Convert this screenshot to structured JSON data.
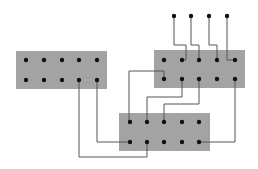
{
  "colors": {
    "background": "#ffffff",
    "block_fill": "#a3a3a3",
    "pin": "#111111",
    "wire": "#555555"
  },
  "blocks": [
    {
      "id": "left",
      "x": 16,
      "y": 51,
      "w": 91,
      "h": 38,
      "pins_x": [
        26,
        44,
        62,
        79,
        97
      ],
      "pins_y": [
        60,
        80
      ]
    },
    {
      "id": "right",
      "x": 154,
      "y": 50,
      "w": 91,
      "h": 38,
      "pins_x": [
        164,
        182,
        199,
        217,
        235
      ],
      "pins_y": [
        60,
        79
      ]
    },
    {
      "id": "bottom",
      "x": 119,
      "y": 113,
      "w": 91,
      "h": 38,
      "pins_x": [
        130,
        147,
        164,
        182,
        199
      ],
      "pins_y": [
        122,
        142
      ]
    }
  ],
  "terminals": [
    {
      "x": 174,
      "y": 16
    },
    {
      "x": 191,
      "y": 16
    },
    {
      "x": 209,
      "y": 16
    },
    {
      "x": 227,
      "y": 16
    }
  ],
  "wires": [
    {
      "points": [
        [
          174,
          16
        ],
        [
          174,
          45
        ],
        [
          186,
          45
        ],
        [
          186,
          60
        ],
        [
          182,
          60
        ]
      ]
    },
    {
      "points": [
        [
          191,
          16
        ],
        [
          191,
          45
        ],
        [
          199,
          45
        ],
        [
          199,
          60
        ]
      ]
    },
    {
      "points": [
        [
          209,
          16
        ],
        [
          209,
          45
        ],
        [
          217,
          45
        ],
        [
          217,
          60
        ]
      ]
    },
    {
      "points": [
        [
          227,
          16
        ],
        [
          227,
          60
        ],
        [
          235,
          60
        ]
      ]
    },
    {
      "points": [
        [
          164,
          79
        ],
        [
          164,
          71
        ],
        [
          129,
          71
        ],
        [
          129,
          122
        ],
        [
          130,
          122
        ]
      ]
    },
    {
      "points": [
        [
          182,
          79
        ],
        [
          182,
          97
        ],
        [
          147,
          97
        ],
        [
          147,
          122
        ]
      ]
    },
    {
      "points": [
        [
          199,
          79
        ],
        [
          199,
          104
        ],
        [
          164,
          104
        ],
        [
          164,
          122
        ]
      ]
    },
    {
      "points": [
        [
          235,
          79
        ],
        [
          235,
          142
        ],
        [
          199,
          142
        ]
      ]
    },
    {
      "points": [
        [
          97,
          80
        ],
        [
          97,
          142
        ],
        [
          130,
          142
        ]
      ]
    },
    {
      "points": [
        [
          79,
          80
        ],
        [
          79,
          157
        ],
        [
          147,
          157
        ],
        [
          147,
          142
        ]
      ]
    }
  ]
}
